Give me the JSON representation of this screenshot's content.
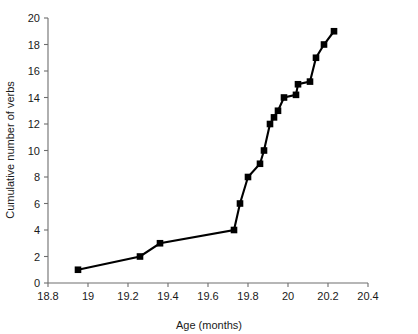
{
  "chart_data": {
    "type": "line",
    "title": "",
    "xlabel": "Age (months)",
    "ylabel": "Cumulative number of verbs",
    "xlim": [
      18.8,
      20.4
    ],
    "ylim": [
      0,
      20
    ],
    "xticks": [
      "18.8",
      "19",
      "19.2",
      "19.4",
      "19.6",
      "19.8",
      "20",
      "20.2",
      "20.4"
    ],
    "xtick_values": [
      18.8,
      19.0,
      19.2,
      19.4,
      19.6,
      19.8,
      20.0,
      20.2,
      20.4
    ],
    "yticks": [
      "0",
      "2",
      "4",
      "6",
      "8",
      "10",
      "12",
      "14",
      "16",
      "18",
      "20"
    ],
    "ytick_values": [
      0,
      2,
      4,
      6,
      8,
      10,
      12,
      14,
      16,
      18,
      20
    ],
    "grid": false,
    "legend": "none",
    "marker": "filled-square",
    "line_color": "#000000",
    "marker_color": "#000000",
    "x": [
      18.95,
      19.26,
      19.36,
      19.73,
      19.76,
      19.8,
      19.86,
      19.88,
      19.91,
      19.93,
      19.95,
      19.98,
      20.04,
      20.05,
      20.11,
      20.14,
      20.18,
      20.23
    ],
    "y": [
      1,
      2,
      3,
      4,
      6,
      8,
      9,
      10,
      12,
      12.5,
      13,
      14,
      14.2,
      15,
      15.2,
      17,
      18,
      19
    ],
    "points": [
      {
        "age": 18.95,
        "verbs": 1
      },
      {
        "age": 19.26,
        "verbs": 2
      },
      {
        "age": 19.36,
        "verbs": 3
      },
      {
        "age": 19.73,
        "verbs": 4
      },
      {
        "age": 19.76,
        "verbs": 6
      },
      {
        "age": 19.8,
        "verbs": 8
      },
      {
        "age": 19.86,
        "verbs": 9
      },
      {
        "age": 19.88,
        "verbs": 10
      },
      {
        "age": 19.91,
        "verbs": 12
      },
      {
        "age": 19.93,
        "verbs": 12.5
      },
      {
        "age": 19.95,
        "verbs": 13
      },
      {
        "age": 19.98,
        "verbs": 14
      },
      {
        "age": 20.04,
        "verbs": 14.2
      },
      {
        "age": 20.05,
        "verbs": 15
      },
      {
        "age": 20.11,
        "verbs": 15.2
      },
      {
        "age": 20.14,
        "verbs": 17
      },
      {
        "age": 20.18,
        "verbs": 18
      },
      {
        "age": 20.23,
        "verbs": 19
      }
    ]
  }
}
